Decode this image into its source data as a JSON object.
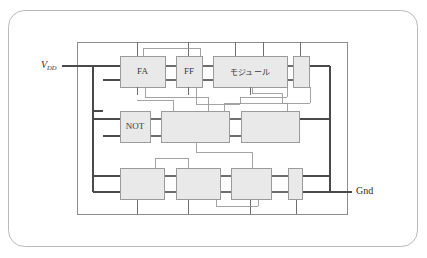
{
  "figure": {
    "kind": "circuit-block-diagram",
    "outer_frame": {
      "shape": "rounded-rectangle",
      "x": 8,
      "y": 10,
      "width": 409,
      "height": 236,
      "radius": 16,
      "stroke": "#b9b9b9",
      "fill": "#ffffff"
    },
    "inner_frame": {
      "x": 77,
      "y": 42,
      "width": 270,
      "height": 172,
      "stroke": "#8d8d8d"
    },
    "colors": {
      "block_fill": "#e9e9e9",
      "block_stroke": "#9b9b9b",
      "wire": "#6f6f6f",
      "wire_thin": "#9a9a9a",
      "power_wire": "#4a4a4a",
      "text": "#3a3a3a",
      "outer_border": "#b9b9b9"
    },
    "rails": [
      {
        "name": "vdd",
        "label": "V",
        "subscript": "DD",
        "label_x": 41,
        "label_y": 66,
        "y": 66,
        "x_from": 62,
        "x_to": 120
      },
      {
        "name": "gnd",
        "label": "Gnd",
        "label_x": 356,
        "label_y": 192,
        "y": 192,
        "x_from": 300,
        "x_to": 352
      }
    ],
    "buses": {
      "left_vertical_x": 93,
      "right_vertical_x": 330,
      "top_horizontal_y": 42,
      "bottom_horizontal_y": 214
    },
    "rows": [
      {
        "name": "row-top",
        "y": 56,
        "height": 31
      },
      {
        "name": "row-middle",
        "y": 111,
        "height": 31
      },
      {
        "name": "row-bottom",
        "y": 168,
        "height": 31
      }
    ],
    "blocks": [
      {
        "id": "fa",
        "label": "FA",
        "label_type": "latin",
        "x": 120,
        "y": 56,
        "width": 45,
        "height": 31,
        "row": "row-top"
      },
      {
        "id": "ff",
        "label": "FF",
        "label_type": "latin",
        "x": 176,
        "y": 56,
        "width": 26,
        "height": 31,
        "row": "row-top"
      },
      {
        "id": "module",
        "label": "モジュール",
        "label_type": "japanese",
        "x": 213,
        "y": 56,
        "width": 74,
        "height": 31,
        "row": "row-top"
      },
      {
        "id": "top-right",
        "label": "",
        "label_type": "none",
        "x": 293,
        "y": 56,
        "width": 16,
        "height": 31,
        "row": "row-top"
      },
      {
        "id": "not",
        "label": "NOT",
        "label_type": "latin",
        "x": 120,
        "y": 111,
        "width": 30,
        "height": 31,
        "row": "row-middle"
      },
      {
        "id": "mid-a",
        "label": "",
        "label_type": "none",
        "x": 161,
        "y": 111,
        "width": 68,
        "height": 31,
        "row": "row-middle"
      },
      {
        "id": "mid-b",
        "label": "",
        "label_type": "none",
        "x": 241,
        "y": 111,
        "width": 58,
        "height": 31,
        "row": "row-middle"
      },
      {
        "id": "bot-a",
        "label": "",
        "label_type": "none",
        "x": 120,
        "y": 168,
        "width": 44,
        "height": 31,
        "row": "row-bottom"
      },
      {
        "id": "bot-b",
        "label": "",
        "label_type": "none",
        "x": 176,
        "y": 168,
        "width": 44,
        "height": 31,
        "row": "row-bottom"
      },
      {
        "id": "bot-c",
        "label": "",
        "label_type": "none",
        "x": 231,
        "y": 168,
        "width": 40,
        "height": 31,
        "row": "row-bottom"
      },
      {
        "id": "bot-right",
        "label": "",
        "label_type": "none",
        "x": 288,
        "y": 168,
        "width": 14,
        "height": 31,
        "row": "row-bottom"
      }
    ],
    "vertical_stubs_top": [
      {
        "x": 137,
        "y_from": 42,
        "y_to": 56
      },
      {
        "x": 188,
        "y_from": 42,
        "y_to": 56
      },
      {
        "x": 235,
        "y_from": 42,
        "y_to": 56
      },
      {
        "x": 263,
        "y_from": 42,
        "y_to": 56
      },
      {
        "x": 300,
        "y_from": 42,
        "y_to": 56
      }
    ],
    "vertical_stubs_bottom": [
      {
        "x": 137,
        "y_from": 199,
        "y_to": 214
      },
      {
        "x": 188,
        "y_from": 199,
        "y_to": 214
      },
      {
        "x": 250,
        "y_from": 199,
        "y_to": 214
      },
      {
        "x": 296,
        "y_from": 199,
        "y_to": 214
      }
    ],
    "block_port_stubs": [
      {
        "name": "fa-in-top",
        "x_from": 93,
        "x_to": 120,
        "y": 66
      },
      {
        "name": "fa-in-bot",
        "x_from": 103,
        "x_to": 120,
        "y": 80
      },
      {
        "name": "not-in-top",
        "x_from": 93,
        "x_to": 120,
        "y": 119
      },
      {
        "name": "not-in-bot",
        "x_from": 103,
        "x_to": 120,
        "y": 136
      },
      {
        "name": "bot-in-top",
        "x_from": 93,
        "x_to": 120,
        "y": 176
      },
      {
        "name": "bot-in-bot",
        "x_from": 103,
        "x_to": 120,
        "y": 192
      },
      {
        "name": "topright-out",
        "x_from": 309,
        "x_to": 330,
        "y": 66
      },
      {
        "name": "midb-out",
        "x_from": 299,
        "x_to": 330,
        "y": 119
      },
      {
        "name": "botright-out",
        "x_from": 302,
        "x_to": 330,
        "y": 176
      }
    ]
  }
}
